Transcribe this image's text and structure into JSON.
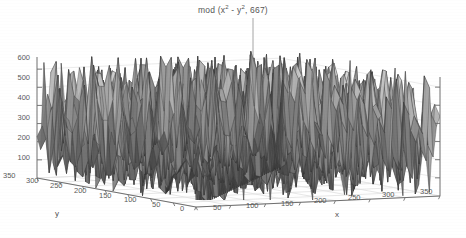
{
  "figure": {
    "background": "#ffffff",
    "width": 466,
    "height": 238
  },
  "title": {
    "prefix": "mod (x",
    "sup1": "2",
    "middle": " - y",
    "sup2": "2",
    "suffix": ", 667)",
    "plain": "mod (x^2 - y^2, 667)",
    "leader_line": true
  },
  "axes": {
    "x_label": "x",
    "y_label": "y",
    "z_label": "",
    "x_ticks": [
      "0",
      "50",
      "100",
      "150",
      "200",
      "250",
      "300",
      "350"
    ],
    "y_ticks": [
      "0",
      "50",
      "100",
      "150",
      "200",
      "250",
      "300",
      "350"
    ],
    "z_ticks": [
      "100",
      "200",
      "300",
      "400",
      "500",
      "600"
    ],
    "grid": true,
    "grid_color": "#d9d9d9",
    "axis_color": "#6b6b6b"
  },
  "chart_data": {
    "type": "surface",
    "xlabel": "x",
    "ylabel": "y",
    "zlabel": "",
    "xlim": [
      0,
      350
    ],
    "ylim": [
      0,
      350
    ],
    "zlim": [
      0,
      667
    ],
    "xticks": [
      0,
      50,
      100,
      150,
      200,
      250,
      300,
      350
    ],
    "yticks": [
      0,
      50,
      100,
      150,
      200,
      250,
      300,
      350
    ],
    "zticks": [
      100,
      200,
      300,
      400,
      500,
      600
    ],
    "grid": true,
    "legend": null,
    "colormap": "gray",
    "surface_facet_count": 420,
    "facet_fill_range": [
      "#3a3a3a",
      "#f0f0f0"
    ],
    "view": {
      "azimuth": -37.5,
      "elevation": 30
    }
  }
}
